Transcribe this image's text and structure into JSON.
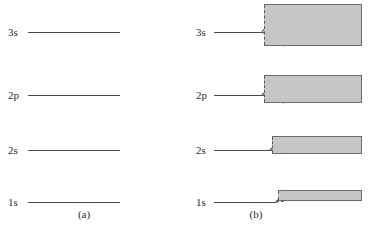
{
  "figure": {
    "width": 376,
    "height": 234,
    "background": "#ffffff",
    "line_color": "#4a4a4a",
    "band_fill": "#c6c6c6",
    "band_stroke": "#6b6b6b"
  },
  "panel_a": {
    "caption": "(a)",
    "caption_x": 84,
    "caption_y": 208,
    "description": "discrete atomic energy levels",
    "levels": [
      {
        "label": "3s",
        "y": 22,
        "line_x": 28,
        "line_width": 92
      },
      {
        "label": "2p",
        "y": 85,
        "line_x": 28,
        "line_width": 92
      },
      {
        "label": "2s",
        "y": 140,
        "line_x": 28,
        "line_width": 92
      },
      {
        "label": "1s",
        "y": 192,
        "line_x": 28,
        "line_width": 92
      }
    ]
  },
  "panel_b": {
    "caption": "(b)",
    "caption_x": 68,
    "caption_y": 208,
    "description": "energy levels broadened into bands",
    "levels": [
      {
        "label": "3s",
        "y": 22,
        "stub_x": 26,
        "stub_width": 48,
        "wedge_x": 74,
        "wedge_width": 22,
        "band_x": 76,
        "band_y": 4,
        "band_width": 98,
        "band_height": 42
      },
      {
        "label": "2p",
        "y": 85,
        "stub_x": 26,
        "stub_width": 48,
        "wedge_x": 74,
        "wedge_width": 22,
        "band_x": 76,
        "band_y": 75,
        "band_width": 98,
        "band_height": 28
      },
      {
        "label": "2s",
        "y": 140,
        "stub_x": 26,
        "stub_width": 56,
        "wedge_x": 82,
        "wedge_width": 14,
        "band_x": 84,
        "band_y": 136,
        "band_width": 90,
        "band_height": 18
      },
      {
        "label": "1s",
        "y": 192,
        "stub_x": 26,
        "stub_width": 62,
        "wedge_x": 88,
        "wedge_width": 10,
        "band_x": 90,
        "band_y": 190,
        "band_width": 84,
        "band_height": 11
      }
    ]
  }
}
